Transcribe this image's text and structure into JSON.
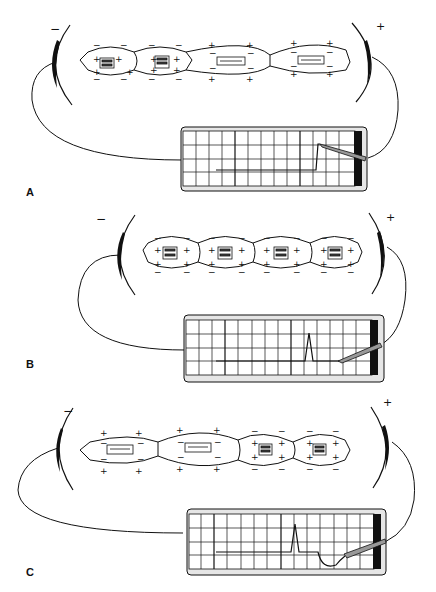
{
  "figure": {
    "panels": [
      {
        "label": "A",
        "electrode_left_sign": "−",
        "electrode_right_sign": "+",
        "description": "Partial depolarization: two cells depolarized (left), two polarized (right); recorder shows upward deflection",
        "cells": [
          "depolarized",
          "depolarized",
          "polarized",
          "polarized"
        ],
        "trace": "upward step deflection"
      },
      {
        "label": "B",
        "electrode_left_sign": "−",
        "electrode_right_sign": "+",
        "description": "Complete depolarization: all four cells depolarized; recorder trace returned to baseline after a spike",
        "cells": [
          "depolarized",
          "depolarized",
          "depolarized",
          "depolarized"
        ],
        "trace": "spike then return to baseline"
      },
      {
        "label": "C",
        "electrode_left_sign": "−",
        "electrode_right_sign": "+",
        "description": "Repolarization: two cells repolarized (left), two still depolarized (right); recorder shows negative deflection",
        "cells": [
          "polarized",
          "polarized",
          "depolarized",
          "depolarized"
        ],
        "trace": "spike, baseline, then downward wave"
      }
    ],
    "charge_symbols": {
      "plus": "+",
      "minus": "−"
    },
    "colors": {
      "ink": "#111111",
      "paper": "#ffffff",
      "recorder_frame": "#d8d8d8"
    }
  }
}
